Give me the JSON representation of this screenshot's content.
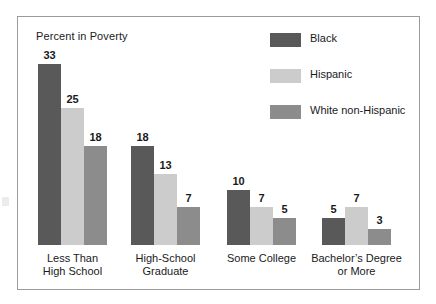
{
  "chart_data": {
    "type": "bar",
    "title": "Percent in Poverty",
    "xlabel": "",
    "ylabel": "Percent in Poverty",
    "ylim": [
      0,
      35
    ],
    "grid": false,
    "legend_position": "top-right",
    "orientation": "vertical",
    "grouping": "grouped",
    "value_labels": true,
    "categories": [
      "Less Than\nHigh School",
      "High-School\nGraduate",
      "Some College",
      "Bachelor’s Degree\nor More"
    ],
    "series": [
      {
        "name": "Black",
        "color": "#595959",
        "values": [
          33,
          18,
          10,
          5
        ]
      },
      {
        "name": "Hispanic",
        "color": "#cccccc",
        "values": [
          25,
          13,
          7,
          7
        ]
      },
      {
        "name": "White non-Hispanic",
        "color": "#8c8c8c",
        "values": [
          18,
          7,
          5,
          3
        ]
      }
    ]
  },
  "groups": [
    {
      "label_line1": "Less Than",
      "label_line2": "High School",
      "bars": [
        {
          "series": "Black",
          "value": 33,
          "value_text": "33",
          "color": "#595959"
        },
        {
          "series": "Hispanic",
          "value": 25,
          "value_text": "25",
          "color": "#cccccc"
        },
        {
          "series": "White non-Hispanic",
          "value": 18,
          "value_text": "18",
          "color": "#8c8c8c"
        }
      ]
    },
    {
      "label_line1": "High-School",
      "label_line2": "Graduate",
      "bars": [
        {
          "series": "Black",
          "value": 18,
          "value_text": "18",
          "color": "#595959"
        },
        {
          "series": "Hispanic",
          "value": 13,
          "value_text": "13",
          "color": "#cccccc"
        },
        {
          "series": "White non-Hispanic",
          "value": 7,
          "value_text": "7",
          "color": "#8c8c8c"
        }
      ]
    },
    {
      "label_line1": "Some College",
      "label_line2": "",
      "bars": [
        {
          "series": "Black",
          "value": 10,
          "value_text": "10",
          "color": "#595959"
        },
        {
          "series": "Hispanic",
          "value": 7,
          "value_text": "7",
          "color": "#cccccc"
        },
        {
          "series": "White non-Hispanic",
          "value": 5,
          "value_text": "5",
          "color": "#8c8c8c"
        }
      ]
    },
    {
      "label_line1": "Bachelor’s Degree",
      "label_line2": "or More",
      "bars": [
        {
          "series": "Black",
          "value": 5,
          "value_text": "5",
          "color": "#595959"
        },
        {
          "series": "Hispanic",
          "value": 7,
          "value_text": "7",
          "color": "#cccccc"
        },
        {
          "series": "White non-Hispanic",
          "value": 3,
          "value_text": "3",
          "color": "#8c8c8c"
        }
      ]
    }
  ],
  "legend": {
    "items": [
      {
        "label": "Black",
        "color": "#595959"
      },
      {
        "label": "Hispanic",
        "color": "#cccccc"
      },
      {
        "label": "White non-Hispanic",
        "color": "#8c8c8c"
      }
    ]
  },
  "layout": {
    "border_color": "#9a9aa0",
    "background": "#ffffff",
    "text_color": "#1a1a1a",
    "baseline_y": 229,
    "px_per_unit": 5.48,
    "bar_width": 23,
    "group_x": [
      21,
      114,
      210,
      305
    ]
  }
}
